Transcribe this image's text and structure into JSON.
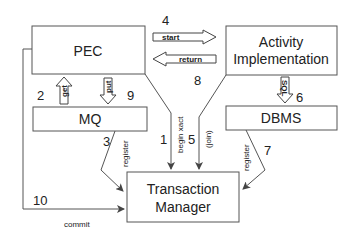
{
  "nodes": {
    "pec": {
      "label": "PEC"
    },
    "activity": {
      "line1": "Activity",
      "line2": "Implementation"
    },
    "mq": {
      "label": "MQ"
    },
    "dbms": {
      "label": "DBMS"
    },
    "tm": {
      "line1": "Transaction",
      "line2": "Manager"
    }
  },
  "edges": {
    "start": {
      "label": "start",
      "number": "4"
    },
    "return": {
      "label": "return",
      "number": "8"
    },
    "get": {
      "label": "get",
      "number": "2"
    },
    "put": {
      "label": "put",
      "number": "9"
    },
    "sql": {
      "label": "SQL",
      "number": "6"
    },
    "mq_register": {
      "label": "register",
      "number": "3"
    },
    "begin_xact": {
      "label": "begin xact",
      "number": "1"
    },
    "join": {
      "label": "(join)",
      "number": "5"
    },
    "dbms_register": {
      "label": "register",
      "number": "7"
    },
    "commit": {
      "label": "commit",
      "number": "10"
    }
  }
}
